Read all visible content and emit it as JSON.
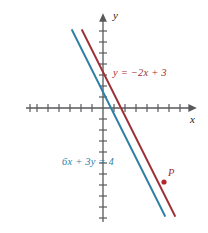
{
  "figure": {
    "kind": "coordinate-plane-line-graph",
    "background_color": "#ffffff",
    "axis_color": "#58595b",
    "axis_label_color": "#231f20"
  },
  "axes": {
    "x_label": "x",
    "y_label": "y",
    "x_label_position": "right-of-arrow",
    "y_label_position": "right-of-arrow",
    "origin_px": {
      "x": 103,
      "y": 108
    },
    "tick_spacing_px": 11,
    "x_ticks_left": 7,
    "x_ticks_right": 7,
    "y_ticks_up": 7,
    "y_ticks_down": 10,
    "tick_half_length_px": 4,
    "x_axis_start_px": 26,
    "x_axis_end_px": 192,
    "y_axis_top_px": 18,
    "y_axis_bottom_px": 222,
    "grid": "off",
    "tick_labels": []
  },
  "labels": {
    "red_equation": "y = −2x + 3",
    "blue_equation": "6x + 3y = 4",
    "point_p": "P"
  },
  "colors": {
    "red_line": "#9e2f34",
    "blue_line": "#2c7fa6",
    "red_text": "#9e2f34",
    "blue_text": "#2c7fa6",
    "point_marker": "#b3272d",
    "axis": "#58595b"
  },
  "chart_data": {
    "type": "line",
    "title": "",
    "xlabel": "x",
    "ylabel": "y",
    "xlim": [
      -7,
      7
    ],
    "ylim": [
      -10,
      7
    ],
    "grid": false,
    "legend": "inline-annotations",
    "series": [
      {
        "name": "y = −2x + 3",
        "color": "#9e2f34",
        "equation": "y = -2x + 3",
        "slope": -2,
        "intercept": 3,
        "annotation": "y = −2x + 3",
        "x": [
          -2.0,
          6.5
        ],
        "y": [
          7.0,
          -10.0
        ],
        "pixel_endpoints": [
          {
            "x": 82,
            "y": 30
          },
          {
            "x": 175,
            "y": 216
          }
        ]
      },
      {
        "name": "6x + 3y = 4",
        "color": "#2c7fa6",
        "equation": "6x + 3y = 4",
        "slope": -2,
        "intercept": 1.3333,
        "annotation": "6x + 3y = 4",
        "x": [
          -2.85,
          5.65
        ],
        "y": [
          7.03,
          -9.97
        ],
        "pixel_endpoints": [
          {
            "x": 72,
            "y": 30
          },
          {
            "x": 165,
            "y": 216
          }
        ]
      }
    ],
    "points": [
      {
        "label": "P",
        "color": "#b3272d",
        "on_series": "y = −2x + 3",
        "pixel": {
          "x": 164,
          "y": 182
        },
        "x": 5.55,
        "y": -6.73
      }
    ],
    "annotations": [
      {
        "text": "y = −2x + 3",
        "color": "#9e2f34",
        "pixel": {
          "x": 113,
          "y": 68
        }
      },
      {
        "text": "6x + 3y = 4",
        "color": "#2c7fa6",
        "pixel": {
          "x": 62,
          "y": 157
        }
      },
      {
        "text": "P",
        "color": "#9e2f34",
        "pixel": {
          "x": 168,
          "y": 168
        }
      }
    ]
  }
}
